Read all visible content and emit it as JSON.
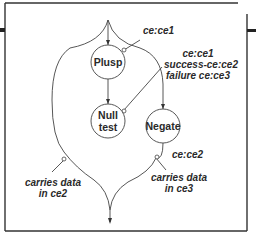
{
  "diagram": {
    "nodes": [
      {
        "id": "plusp",
        "label": "Plusp"
      },
      {
        "id": "null-test",
        "label": "Null\ntest"
      },
      {
        "id": "negate",
        "label": "Negate"
      }
    ],
    "annotations": {
      "plusp_out": "ce:ce1",
      "nulltest_in_1": "ce:ce1",
      "nulltest_in_2": "success-ce:ce2",
      "nulltest_in_3": "failure ce:ce3",
      "negate_out": "ce:ce2",
      "left_branch_1": "carries data",
      "left_branch_2": "in ce2",
      "right_branch_1": "carries data",
      "right_branch_2": "in ce3"
    },
    "colors": {
      "stroke": "#444444",
      "frame": "#333333",
      "background": "#ffffff"
    }
  }
}
